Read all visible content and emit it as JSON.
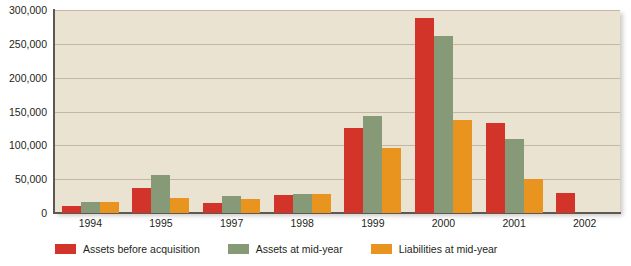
{
  "chart_data": {
    "type": "bar",
    "title": "",
    "subtitle": "",
    "xlabel": "",
    "ylabel": "",
    "ylim": [
      0,
      300000
    ],
    "ytick_values": [
      0,
      50000,
      100000,
      150000,
      200000,
      250000,
      300000
    ],
    "ytick_labels": [
      "0",
      "50,000",
      "100,000",
      "150,000",
      "200,000",
      "250,000",
      "300,000"
    ],
    "grid": true,
    "grid_axis": "y",
    "legend_position": "bottom",
    "categories": [
      "1994",
      "1995",
      "1997",
      "1998",
      "1999",
      "2000",
      "2001",
      "2002"
    ],
    "series": [
      {
        "name": "Assets before acquisition",
        "color": "#d2342a",
        "values": [
          10000,
          37000,
          15000,
          26000,
          125000,
          288000,
          133000,
          30000
        ]
      },
      {
        "name": "Assets at mid-year",
        "color": "#879a78",
        "values": [
          17000,
          56000,
          25000,
          28000,
          143000,
          262000,
          110000,
          null
        ]
      },
      {
        "name": "Liabilities at mid-year",
        "color": "#e8941f",
        "values": [
          17000,
          22000,
          21000,
          28000,
          96000,
          137000,
          50000,
          null
        ]
      }
    ]
  },
  "style": {
    "plot_background": "#eae3d2",
    "page_background": "#ffffff",
    "axis_color": "#5c5954",
    "gridline_color": "#c3b9a3",
    "text_color": "#231f20"
  }
}
